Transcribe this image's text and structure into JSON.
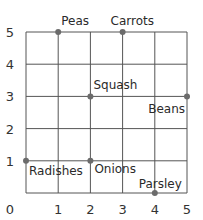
{
  "chart_data": {
    "type": "scatter",
    "title": "",
    "xlabel": "",
    "ylabel": "",
    "xlim": [
      0,
      5
    ],
    "ylim": [
      0,
      5
    ],
    "grid": true,
    "x_ticks": [
      "0",
      "1",
      "2",
      "3",
      "4",
      "5"
    ],
    "y_ticks": [
      "1",
      "2",
      "3",
      "4",
      "5"
    ],
    "points": [
      {
        "name": "Peas",
        "x": 1,
        "y": 5
      },
      {
        "name": "Carrots",
        "x": 3,
        "y": 5
      },
      {
        "name": "Squash",
        "x": 2,
        "y": 3
      },
      {
        "name": "Beans",
        "x": 5,
        "y": 3
      },
      {
        "name": "Radishes",
        "x": 0,
        "y": 1
      },
      {
        "name": "Onions",
        "x": 2,
        "y": 1
      },
      {
        "name": "Parsley",
        "x": 4,
        "y": 0
      }
    ]
  },
  "colors": {
    "grid": "#555555",
    "point": "#6b6b6b",
    "text": "#2a2a2a"
  }
}
